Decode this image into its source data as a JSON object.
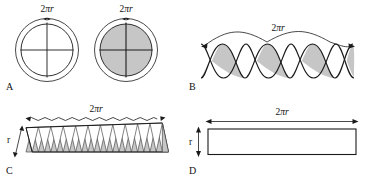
{
  "figure": {
    "background_color": "#ffffff",
    "stroke_color": "#1a1a1a",
    "shade_color": "#c6c6c6",
    "shade_stroke_color": "#4d4d4d"
  },
  "panels": [
    {
      "id": "A",
      "label": "A",
      "caption_label": "A",
      "items": [
        {
          "name": "circle-unshaded",
          "circumference_label": "2πr",
          "shaded": false,
          "sectors": 4
        },
        {
          "name": "circle-shaded",
          "circumference_label": "2πr",
          "shaded": true,
          "sectors": 4
        }
      ]
    },
    {
      "id": "B",
      "label": "B",
      "caption_label": "B",
      "arc_label": "2πr",
      "lens_count": 4,
      "wave_count": 2
    },
    {
      "id": "C",
      "label": "C",
      "caption_label": "C",
      "top_label": "2πr",
      "side_label": "r",
      "triangle_pairs": 11
    },
    {
      "id": "D",
      "label": "D",
      "caption_label": "D",
      "width_label": "2πr",
      "height_label": "r"
    }
  ],
  "labels": {
    "two_pi_r_prefix": "2π",
    "radius_var": "r",
    "panel_a": "A",
    "panel_b": "B",
    "panel_c": "C",
    "panel_d": "D",
    "dim_a1": "2πr",
    "dim_a2": "2πr",
    "dim_b": "2πr",
    "dim_c_top": "2πr",
    "dim_c_side": "r",
    "dim_d_top": "2πr",
    "dim_d_side": "r"
  }
}
